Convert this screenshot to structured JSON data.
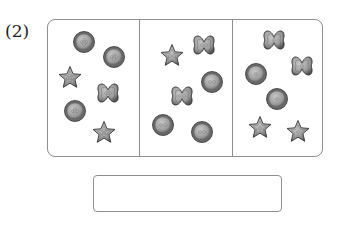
{
  "problem": {
    "number_label": "(2)",
    "groups": [
      {
        "items": [
          {
            "shape": "circle",
            "holes": 4,
            "x": 84,
            "y": 42
          },
          {
            "shape": "circle",
            "holes": 4,
            "x": 114,
            "y": 57
          },
          {
            "shape": "star",
            "holes": 4,
            "x": 70,
            "y": 78
          },
          {
            "shape": "flower",
            "holes": 4,
            "x": 108,
            "y": 93
          },
          {
            "shape": "circle",
            "holes": 4,
            "x": 75,
            "y": 111
          },
          {
            "shape": "star",
            "holes": 4,
            "x": 104,
            "y": 133
          }
        ]
      },
      {
        "items": [
          {
            "shape": "star",
            "holes": 2,
            "x": 172,
            "y": 56
          },
          {
            "shape": "flower",
            "holes": 2,
            "x": 204,
            "y": 45
          },
          {
            "shape": "circle",
            "holes": 2,
            "x": 212,
            "y": 82
          },
          {
            "shape": "flower",
            "holes": 2,
            "x": 182,
            "y": 96
          },
          {
            "shape": "circle",
            "holes": 2,
            "x": 163,
            "y": 125
          },
          {
            "shape": "circle",
            "holes": 2,
            "x": 202,
            "y": 132
          }
        ]
      },
      {
        "items": [
          {
            "shape": "flower",
            "holes": 1,
            "x": 274,
            "y": 40
          },
          {
            "shape": "flower",
            "holes": 1,
            "x": 302,
            "y": 66
          },
          {
            "shape": "circle",
            "holes": 1,
            "x": 256,
            "y": 74
          },
          {
            "shape": "circle",
            "holes": 1,
            "x": 277,
            "y": 99
          },
          {
            "shape": "star",
            "holes": 1,
            "x": 260,
            "y": 128
          },
          {
            "shape": "star",
            "holes": 1,
            "x": 298,
            "y": 132
          }
        ]
      }
    ],
    "answer_value": ""
  },
  "colors": {
    "border": "#8f8f8f",
    "button_fill": "#9a9a9a",
    "button_dark": "#555555",
    "button_light": "#c8c8c8"
  }
}
